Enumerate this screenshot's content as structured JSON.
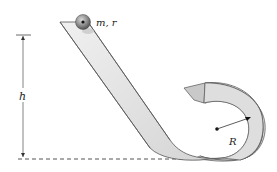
{
  "diagram": {
    "type": "physics-loop-the-loop",
    "labels": {
      "ball": "m, r",
      "height": "h",
      "loop_radius": "R"
    },
    "colors": {
      "track_fill": "#e6e6e6",
      "track_edge": "#555555",
      "ball": "#8a8a8a",
      "line": "#444444",
      "dashed": "#555555"
    },
    "elements": [
      {
        "name": "ball",
        "description": "sphere of mass m and radius r at top of ramp"
      },
      {
        "name": "ramp",
        "description": "inclined track descending from upper-left"
      },
      {
        "name": "loop",
        "description": "circular loop track of radius R"
      },
      {
        "name": "height-dimension",
        "description": "vertical arrow indicating height h"
      },
      {
        "name": "baseline",
        "description": "dashed ground reference line"
      }
    ]
  }
}
